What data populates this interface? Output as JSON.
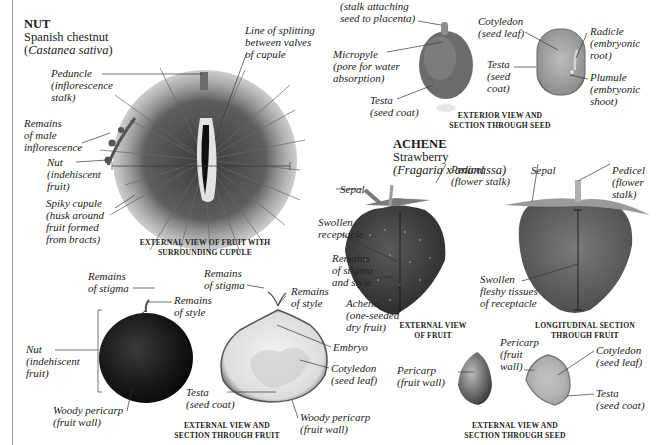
{
  "nut_section": {
    "type_title": "NUT",
    "common_name": "Spanish chestnut",
    "sci_open": "(",
    "sci_name": "Castanea sativa",
    "sci_close": ")",
    "cupule_labels": {
      "peduncle": "Peduncle\n(inflorescence\nstalk)",
      "splitting_line": "Line of splitting\nbetween valves\nof cupule",
      "male_inflorescence": "Remains\nof male\ninflorescence",
      "nut": "Nut\n(indehiscent\nfruit)",
      "spiky_cupule": "Spiky cupule\n(husk around\nfruit formed\nfrom bracts)"
    },
    "cupule_caption": "EXTERNAL VIEW OF FRUIT WITH\nSURROUNDING CUPULE",
    "fruit_labels": {
      "stigma_left": "Remains\nof stigma",
      "style_left": "Remains\nof style",
      "nut": "Nut\n(indehiscent\nfruit)",
      "woody_pericarp_left": "Woody pericarp\n(fruit wall)",
      "stigma_right": "Remains\nof stigma",
      "style_right": "Remains\nof style",
      "embryo": "Embryo",
      "cotyledon": "Cotyledon\n(seed leaf)",
      "testa": "Testa\n(seed coat)",
      "woody_pericarp_right": "Woody pericarp\n(fruit wall)"
    },
    "fruit_caption": "EXTERNAL VIEW AND\nSECTION THROUGH FRUIT"
  },
  "seed_section": {
    "labels": {
      "funicle": "(stalk attaching\nseed to placenta)",
      "micropyle": "Micropyle\n(pore for water\nabsorption)",
      "testa_ext": "Testa\n(seed coat)",
      "cotyledon": "Cotyledon\n(seed leaf)",
      "testa_sec": "Testa\n(seed\ncoat)",
      "radicle": "Radicle\n(embryonic\nroot)",
      "plumule": "Plumule\n(embryonic\nshoot)"
    },
    "caption": "EXTERIOR VIEW AND\nSECTION THROUGH SEED"
  },
  "achene_section": {
    "type_title": "ACHENE",
    "common_name": "Strawberry",
    "sci_name": "(Fragaria x ananassa)",
    "ext_labels": {
      "sepal": "Sepal",
      "pedicel": "Pedicel\n(flower stalk)",
      "receptacle": "Swollen\nreceptacle",
      "stigma_style": "Remains\nof stigma\nand style",
      "achene": "Achene\n(one-seeded\ndry fruit)"
    },
    "ext_caption": "EXTERNAL VIEW\nOF FRUIT",
    "long_labels": {
      "sepal": "Sepal",
      "pedicel": "Pedicel\n(flower\nstalk)",
      "fleshy": "Swollen\nfleshy tissues\nof receptacle"
    },
    "long_caption": "LONGITUDINAL SECTION\nTHROUGH FRUIT",
    "seed_labels": {
      "pericarp_ext": "Pericarp\n(fruit wall)",
      "pericarp_sec": "Pericarp\n(fruit\nwall)",
      "cotyledon": "Cotyledon\n(seed leaf)",
      "testa": "Testa\n(seed coat)"
    },
    "seed_caption": "EXTERNAL VIEW AND\nSECTION THROUGH SEED"
  },
  "colors": {
    "background": "#ffffff",
    "text": "#1a1a1a",
    "leader_line": "#333333",
    "page_rule": "#9a9a9a"
  }
}
